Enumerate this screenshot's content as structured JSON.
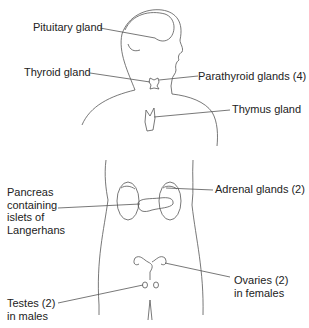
{
  "labels": {
    "pituitary": "Pituitary gland",
    "thyroid": "Thyroid gland",
    "parathyroid": "Parathyroid glands (4)",
    "thymus": "Thymus gland",
    "adrenal": "Adrenal glands (2)",
    "pancreas": [
      "Pancreas",
      "containing",
      "islets of",
      "Langerhans"
    ],
    "ovaries": [
      "Ovaries (2)",
      "in females"
    ],
    "testes": [
      "Testes (2)",
      "in males"
    ]
  },
  "colors": {
    "line": "#555555",
    "text": "#222222",
    "background": "#ffffff"
  }
}
